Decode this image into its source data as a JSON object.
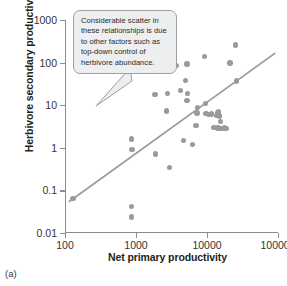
{
  "panel": {
    "letter": "(a)"
  },
  "callout": {
    "text": "Considerable scatter in these relationships is due to other factors such as top-down control of herbivore abundance.",
    "background": "#eceef0",
    "border": "#9aa0a6"
  },
  "style": {
    "point_color": "#9a9a9a",
    "line_color": "#9a9a9a",
    "axis_color": "#8c8c8c",
    "text_color": "#231f20"
  },
  "chart_data": {
    "type": "scatter",
    "title": "",
    "xlabel": "Net primary productivity",
    "ylabel": "Herbivore secondary productivity",
    "xscale": "log",
    "yscale": "log",
    "xlim": [
      100,
      100000
    ],
    "ylim": [
      0.01,
      1000
    ],
    "xticks": [
      100,
      1000,
      10000,
      100000
    ],
    "xticklabels": [
      "100",
      "1000",
      "10000",
      "100000"
    ],
    "yticks": [
      0.01,
      0.1,
      1,
      10,
      100,
      1000
    ],
    "yticklabels": [
      "0.01",
      "0.1",
      "1",
      "10",
      "100",
      "1000"
    ],
    "grid": false,
    "legend": null,
    "points": [
      [
        130,
        0.065
      ],
      [
        870,
        1.6
      ],
      [
        880,
        0.9
      ],
      [
        860,
        0.042
      ],
      [
        860,
        0.024
      ],
      [
        1850,
        18
      ],
      [
        1900,
        0.72
      ],
      [
        2750,
        19
      ],
      [
        2700,
        7.3
      ],
      [
        2950,
        0.34
      ],
      [
        3700,
        85
      ],
      [
        4200,
        22
      ],
      [
        5200,
        92
      ],
      [
        5000,
        38
      ],
      [
        5300,
        19
      ],
      [
        5200,
        13
      ],
      [
        4700,
        1.5
      ],
      [
        6200,
        1.2
      ],
      [
        7300,
        8.8
      ],
      [
        7200,
        6.6
      ],
      [
        7000,
        3.3
      ],
      [
        9200,
        140
      ],
      [
        9500,
        11
      ],
      [
        9700,
        6.4
      ],
      [
        10500,
        6.0
      ],
      [
        11500,
        6.2
      ],
      [
        12500,
        3.0
      ],
      [
        13500,
        5.8
      ],
      [
        14000,
        6.5
      ],
      [
        14500,
        7.0
      ],
      [
        15000,
        5.6
      ],
      [
        15500,
        4.2
      ],
      [
        14200,
        2.9
      ],
      [
        15800,
        2.8
      ],
      [
        17500,
        2.9
      ],
      [
        19000,
        2.8
      ],
      [
        21000,
        98
      ],
      [
        25000,
        260
      ],
      [
        26000,
        37
      ]
    ],
    "trendline": {
      "type": "log-log-linear",
      "x": [
        115,
        90000
      ],
      "y": [
        0.055,
        165
      ]
    }
  }
}
